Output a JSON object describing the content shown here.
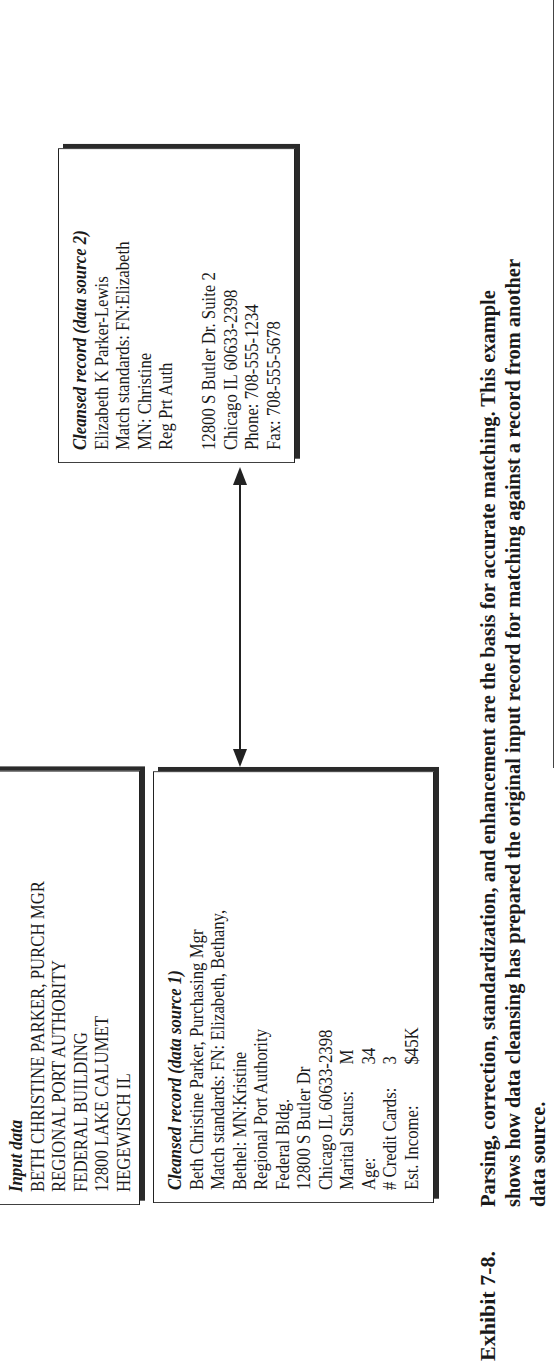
{
  "exhibit": {
    "label": "Exhibit 7-8.",
    "caption_lines": [
      "Parsing, correction, standardization, and enhancement are the basis for accurate matching. This example",
      "shows how data cleansing has prepared the original input record for matching against a record from another",
      "data source."
    ]
  },
  "input_box": {
    "heading": "Input data",
    "lines": [
      "BETH CHRISTINE PARKER, PURCH MGR",
      "REGIONAL PORT AUTHORITY",
      "FEDERAL BUILDING",
      "12800 LAKE CALUMET",
      "HEGEWISCH IL"
    ]
  },
  "cleansed_record_1": {
    "heading": "Cleansed record (data source 1)",
    "lines": [
      "Beth Christine Parker, Purchasing Mgr",
      "Match standards: FN: Elizabeth, Bethany,",
      "Bethel: MN:Kristine",
      "Regional Port Authority",
      "Federal Bldg.",
      "12800 S Butler Dr",
      "Chicago IL 60633-2398"
    ],
    "attributes": [
      {
        "key": "Marital Status:",
        "value": "M"
      },
      {
        "key": "Age:",
        "value": "34"
      },
      {
        "key": "# Credit Cards:",
        "value": "3"
      },
      {
        "key": "Est. Income:",
        "value": "$45K"
      }
    ]
  },
  "cleansed_record_2": {
    "heading": "Cleansed record (data source 2)",
    "lines_top": [
      "Elizabeth K Parker-Lewis",
      "Match standards: FN:Elizabeth",
      "MN: Christine",
      "Reg Prt Auth"
    ],
    "lines_bottom": [
      "12800 S Butler Dr. Suite 2",
      "Chicago IL 60633-2398",
      "Phone: 708-555-1234",
      "Fax: 708-555-5678"
    ]
  },
  "connector": {
    "type": "double-headed-arrow",
    "from": "cleansed_record_1",
    "to": "cleansed_record_2"
  }
}
